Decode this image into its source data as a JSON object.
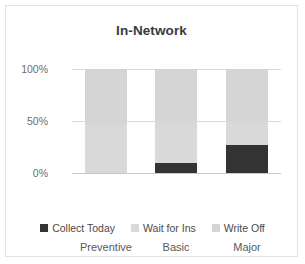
{
  "chart_data": {
    "type": "bar",
    "subtype": "stacked-percent",
    "title": "In-Network",
    "xlabel": "",
    "ylabel": "",
    "categories": [
      "Preventive",
      "Basic",
      "Major"
    ],
    "ylim": [
      0,
      100
    ],
    "ytick_labels": [
      "0%",
      "50%",
      "100%"
    ],
    "ytick_values": [
      0,
      50,
      100
    ],
    "grid": true,
    "legend_position": "bottom",
    "series": [
      {
        "name": "Collect Today",
        "color": "#333333",
        "values": [
          0,
          10,
          27
        ]
      },
      {
        "name": "Wait for Ins",
        "color": "#d9d9d9",
        "values": [
          46,
          40,
          23
        ]
      },
      {
        "name": "Write Off",
        "color": "#d5d5d5",
        "values": [
          54,
          50,
          50
        ]
      }
    ]
  },
  "axes": {
    "y": {
      "tick_100": "100%",
      "tick_50": "50%",
      "tick_0": "0%"
    },
    "x": {
      "cat_0": "Preventive",
      "cat_1": "Basic",
      "cat_2": "Major"
    }
  },
  "legend": {
    "items": [
      {
        "label": "Collect Today",
        "color": "#333333"
      },
      {
        "label": "Wait for Ins",
        "color": "#d9d9d9"
      },
      {
        "label": "Write Off",
        "color": "#d5d5d5"
      }
    ]
  },
  "colors": {
    "collect_today": "#333333",
    "wait_for_ins": "#d9d9d9",
    "write_off": "#d5d5d5",
    "gridline": "#d9d9d9",
    "frame_border": "#e2e2e2",
    "title_text": "#3a3a3a",
    "tick_text": "#6d6d6d"
  }
}
